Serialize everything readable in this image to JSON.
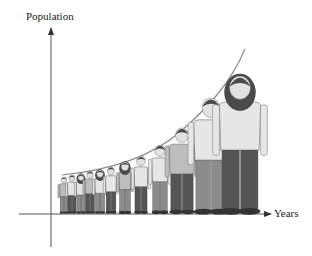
{
  "diagram": {
    "title": "",
    "y_axis_label": "Population",
    "x_axis_label": "Years",
    "curve": "exponential growth",
    "colors": {
      "axis": "#555555",
      "curve": "#8a8a8a",
      "skin": "#e2e2e2",
      "hair": "#4a4a4a",
      "shirt_light": "#e6e6e6",
      "shirt_mid": "#bdbdbd",
      "pants_dark": "#555555",
      "pants_mid": "#8c8c8c",
      "shoes": "#333333"
    },
    "people": [
      {
        "x": 64,
        "height": 36,
        "type": "child"
      },
      {
        "x": 72,
        "height": 38,
        "type": "child"
      },
      {
        "x": 81,
        "height": 39,
        "type": "child"
      },
      {
        "x": 90,
        "height": 42,
        "type": "child"
      },
      {
        "x": 100,
        "height": 43,
        "type": "child"
      },
      {
        "x": 111,
        "height": 46,
        "type": "child"
      },
      {
        "x": 125,
        "height": 51,
        "type": "teen"
      },
      {
        "x": 141,
        "height": 57,
        "type": "teen"
      },
      {
        "x": 160,
        "height": 68,
        "type": "teen"
      },
      {
        "x": 182,
        "height": 85,
        "type": "adult"
      },
      {
        "x": 211,
        "height": 115,
        "type": "adult"
      },
      {
        "x": 240,
        "height": 137,
        "type": "adult"
      }
    ]
  },
  "chart_data": {
    "type": "line",
    "title": "",
    "xlabel": "Years",
    "ylabel": "Population",
    "x": [
      1,
      2,
      3,
      4,
      5,
      6,
      7,
      8,
      9,
      10,
      11,
      12
    ],
    "values": [
      36,
      38,
      39,
      42,
      43,
      46,
      51,
      57,
      68,
      85,
      115,
      137
    ],
    "grid": false
  }
}
